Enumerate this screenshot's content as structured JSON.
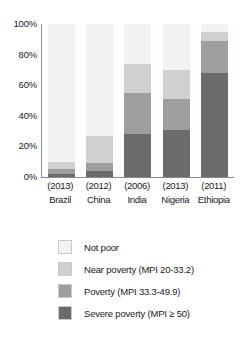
{
  "chart_data": {
    "type": "bar",
    "subtype": "stacked-bar-100-percent",
    "title": "",
    "xlabel": "",
    "ylabel": "",
    "ylim": [
      0,
      100
    ],
    "y_ticks": [
      0,
      20,
      40,
      60,
      80,
      100
    ],
    "y_tick_labels": [
      "0%",
      "20%",
      "40%",
      "60%",
      "80%",
      "100%"
    ],
    "grid": false,
    "legend_position": "bottom",
    "categories": [
      "Brazil",
      "China",
      "India",
      "Nigeria",
      "Ethiopia"
    ],
    "category_years": [
      "(2013)",
      "(2012)",
      "(2006)",
      "(2013)",
      "(2011)"
    ],
    "series": [
      {
        "name": "Not poor",
        "color": "#f2f2f2",
        "values": [
          90,
          73,
          26,
          30,
          5
        ]
      },
      {
        "name": "Near poverty (MPI 20-33.2)",
        "color": "#d0d0d0",
        "values": [
          5,
          18,
          19,
          19,
          6
        ]
      },
      {
        "name": "Poverty (MPI 33.3-49.9)",
        "color": "#9e9e9e",
        "values": [
          3,
          5,
          27,
          20,
          21
        ]
      },
      {
        "name": "Severe poverty (MPI ≥ 50)",
        "color": "#6b6b6b",
        "values": [
          2,
          4,
          28,
          31,
          68
        ]
      }
    ]
  },
  "axis": {
    "y_labels": [
      {
        "text": "100%",
        "value": 100
      },
      {
        "text": "80%",
        "value": 80
      },
      {
        "text": "60%",
        "value": 60
      },
      {
        "text": "40%",
        "value": 40
      },
      {
        "text": "20%",
        "value": 20
      },
      {
        "text": "0%",
        "value": 0
      }
    ],
    "x_groups": [
      {
        "year": "(2013)",
        "country": "Brazil"
      },
      {
        "year": "(2012)",
        "country": "China"
      },
      {
        "year": "(2006)",
        "country": "India"
      },
      {
        "year": "(2013)",
        "country": "Nigeria"
      },
      {
        "year": "(2011)",
        "country": "Ethiopia"
      }
    ]
  },
  "legend": {
    "items": [
      {
        "label": "Not poor",
        "color": "#f2f2f2"
      },
      {
        "label": "Near poverty (MPI 20-33.2)",
        "color": "#d0d0d0"
      },
      {
        "label": "Poverty (MPI 33.3-49.9)",
        "color": "#9e9e9e"
      },
      {
        "label": "Severe poverty (MPI ≥ 50)",
        "color": "#6b6b6b"
      }
    ]
  },
  "style": {
    "axis_color": "#8a8a8a",
    "text_color": "#1a1a1a",
    "plot_background": "#fdfdfd",
    "page_background": "#ffffff"
  }
}
